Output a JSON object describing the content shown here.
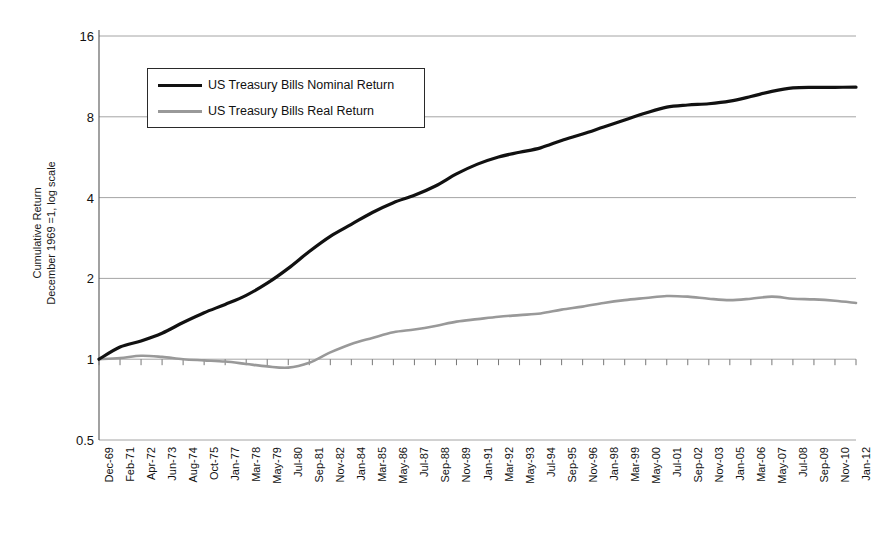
{
  "chart_data": {
    "type": "line",
    "title": "",
    "xlabel": "",
    "ylabel": "Cumulative Return\nDecember 1969 =1, log scale",
    "ylabel_line1": "Cumulative Return",
    "ylabel_line2": "December 1969 =1, log scale",
    "yscale": "log",
    "ylim": [
      0.5,
      16
    ],
    "ytick_labels": [
      "16",
      "8",
      "4",
      "2",
      "1",
      "0.5"
    ],
    "ytick_values": [
      16,
      8,
      4,
      2,
      1,
      0.5
    ],
    "grid": true,
    "legend_position": "upper-left-inside",
    "x_range": [
      "Dec-69",
      "Jan-12"
    ],
    "categories": [
      "Dec-69",
      "Feb-71",
      "Apr-72",
      "Jun-73",
      "Aug-74",
      "Oct-75",
      "Jan-77",
      "Mar-78",
      "May-79",
      "Jul-80",
      "Sep-81",
      "Nov-82",
      "Jan-84",
      "Mar-85",
      "May-86",
      "Jul-87",
      "Sep-88",
      "Nov-89",
      "Jan-91",
      "Mar-92",
      "May-93",
      "Jul-94",
      "Sep-95",
      "Nov-96",
      "Jan-98",
      "Mar-99",
      "May-00",
      "Jul-01",
      "Sep-02",
      "Nov-03",
      "Jan-05",
      "Mar-06",
      "May-07",
      "Jul-08",
      "Sep-09",
      "Nov-10",
      "Jan-12"
    ],
    "series": [
      {
        "name": "US Treasury Bills Nominal Return",
        "color": "#111111",
        "values": [
          1.0,
          1.11,
          1.17,
          1.25,
          1.37,
          1.49,
          1.6,
          1.73,
          1.92,
          2.18,
          2.52,
          2.87,
          3.18,
          3.52,
          3.83,
          4.08,
          4.42,
          4.9,
          5.33,
          5.67,
          5.9,
          6.13,
          6.53,
          6.9,
          7.33,
          7.78,
          8.26,
          8.69,
          8.85,
          8.95,
          9.15,
          9.52,
          9.95,
          10.25,
          10.3,
          10.3,
          10.32
        ]
      },
      {
        "name": "US Treasury Bills Real Return",
        "color": "#999999",
        "values": [
          1.0,
          1.01,
          1.03,
          1.02,
          1.0,
          0.99,
          0.98,
          0.96,
          0.94,
          0.93,
          0.97,
          1.06,
          1.14,
          1.2,
          1.26,
          1.29,
          1.33,
          1.38,
          1.41,
          1.44,
          1.46,
          1.48,
          1.53,
          1.57,
          1.62,
          1.66,
          1.69,
          1.72,
          1.71,
          1.68,
          1.66,
          1.68,
          1.71,
          1.68,
          1.67,
          1.65,
          1.62
        ]
      }
    ]
  },
  "legend": {
    "items": [
      {
        "label": "US Treasury Bills Nominal Return"
      },
      {
        "label": "US Treasury Bills Real Return"
      }
    ]
  }
}
